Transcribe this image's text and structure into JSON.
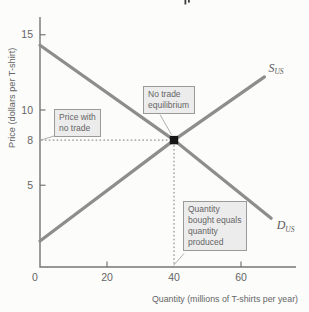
{
  "figure": {
    "annotations": {
      "price_note": "Price with no trade",
      "equilibrium_note": "No trade equilibrium",
      "quantity_note": "Quantity bought equals quantity produced"
    }
  },
  "chart_data": {
    "type": "line",
    "title": "",
    "xlabel": "Quantity (millions of T-shirts per year)",
    "ylabel": "Price (dollars per T-shirt)",
    "xlim": [
      0,
      76
    ],
    "ylim": [
      0,
      16.5
    ],
    "x_tick_labels": [
      0,
      20,
      40,
      60
    ],
    "x_tick_marks": [
      20,
      60
    ],
    "y_tick_labels": [
      5,
      8,
      10,
      15
    ],
    "y_tick_marks": [
      5,
      10,
      15
    ],
    "grid": false,
    "legend_position": "curve-end-labels",
    "series": [
      {
        "name": "S",
        "subscript": "US",
        "role": "supply",
        "points": [
          [
            0,
            1.3
          ],
          [
            40,
            8
          ],
          [
            67,
            12.2
          ]
        ]
      },
      {
        "name": "D",
        "subscript": "US",
        "role": "demand",
        "points": [
          [
            0,
            14.3
          ],
          [
            40,
            8
          ],
          [
            69,
            2.8
          ]
        ]
      }
    ],
    "equilibrium": {
      "quantity": 40,
      "price": 8
    },
    "guides": [
      {
        "axis": "y",
        "value": 8,
        "style": "dotted"
      },
      {
        "axis": "x",
        "value": 40,
        "style": "dotted"
      }
    ]
  },
  "colors": {
    "bg": "#fcfcfb",
    "curve": "#8d8d8d",
    "axis": "#757575",
    "text": "#656565",
    "notebg": "#ececec",
    "noteborder": "#9a9a9a",
    "leader": "#9b9b9b",
    "guide": "#7a7a7a",
    "equilibrium_dot": "#161616"
  }
}
